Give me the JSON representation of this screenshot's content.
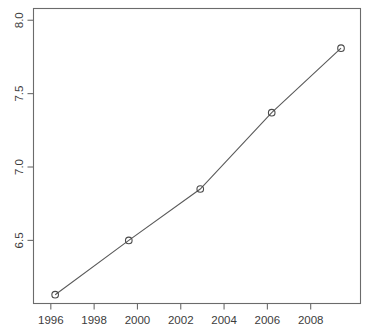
{
  "chart_data": {
    "type": "line",
    "title": "",
    "subtitle": "",
    "xlabel": "",
    "ylabel": "",
    "xlim": [
      1995.2,
      2010.3
    ],
    "ylim": [
      6.07,
      8.08
    ],
    "grid": false,
    "legend": null,
    "marker": "open-circle",
    "line_color": "#5a5a5a",
    "point_color": "#4a4a4a",
    "axis_color": "#6b6b6b",
    "background": "#ffffff",
    "x": [
      1996.2,
      1999.6,
      2002.9,
      2006.2,
      2009.4
    ],
    "values": [
      6.13,
      6.5,
      6.85,
      7.37,
      7.81
    ],
    "points": [
      {
        "x": 1996.2,
        "y": 6.13
      },
      {
        "x": 1999.6,
        "y": 6.5
      },
      {
        "x": 2002.9,
        "y": 6.85
      },
      {
        "x": 2006.2,
        "y": 7.37
      },
      {
        "x": 2009.4,
        "y": 7.81
      }
    ],
    "xticks": [
      1996,
      1998,
      2000,
      2002,
      2004,
      2006,
      2008
    ],
    "xticklabels": [
      "1996",
      "1998",
      "2000",
      "2002",
      "2004",
      "2006",
      "2008"
    ],
    "yticks": [
      6.5,
      7.0,
      7.5,
      8.0
    ],
    "yticklabels": [
      "6.5",
      "7.0",
      "7.5",
      "8.0"
    ]
  }
}
